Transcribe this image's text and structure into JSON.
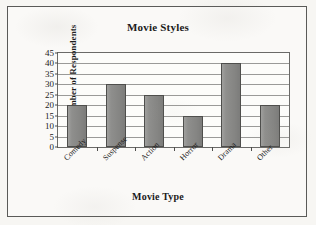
{
  "chart_data": {
    "type": "bar",
    "title": "Movie Styles",
    "xlabel": "Movie Type",
    "ylabel": "Number of Respondents",
    "categories": [
      "Comedy",
      "Suspense",
      "Action",
      "Horror",
      "Drama",
      "Other"
    ],
    "values": [
      20,
      30,
      25,
      15,
      40,
      20
    ],
    "ylim": [
      0,
      45
    ],
    "ytick_step": 5,
    "yticks": [
      0,
      5,
      10,
      15,
      20,
      25,
      30,
      35,
      40,
      45
    ],
    "ytick_labels": [
      "0",
      "5",
      "10",
      "15",
      "20",
      "25",
      "30",
      "35",
      "40",
      "45"
    ],
    "grid": true,
    "grid_axis": "y",
    "legend": false,
    "legend_position": "none",
    "bar_color": "#8a8a88",
    "bar_edge_color": "#4e4e4c",
    "plot_background": "#fcfcfa",
    "axis_color": "#6a6a68",
    "text_color": "#1b1b1b",
    "xtick_label_rotation": -45
  }
}
